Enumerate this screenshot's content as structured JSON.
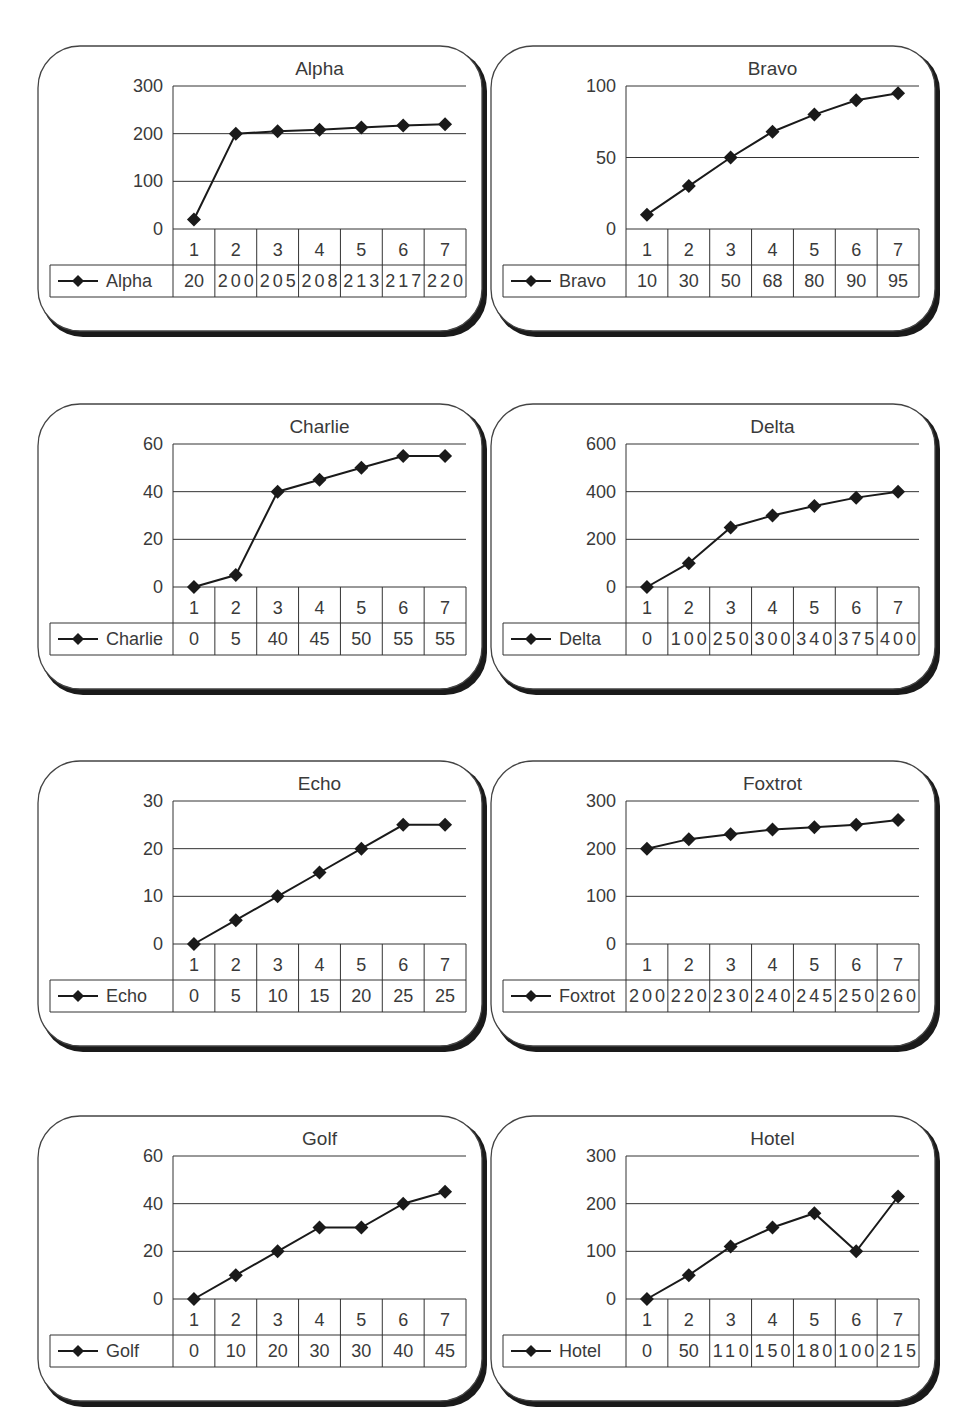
{
  "chart_data": [
    {
      "type": "line",
      "title": "Alpha",
      "categories": [
        "1",
        "2",
        "3",
        "4",
        "5",
        "6",
        "7"
      ],
      "series": [
        {
          "name": "Alpha",
          "values": [
            20,
            200,
            205,
            208,
            213,
            217,
            220
          ]
        }
      ],
      "yticks": [
        0,
        100,
        200,
        300
      ],
      "ylim": [
        0,
        300
      ],
      "xlabel": "",
      "ylabel": "",
      "grid": true,
      "legend_position": "data-table"
    },
    {
      "type": "line",
      "title": "Bravo",
      "categories": [
        "1",
        "2",
        "3",
        "4",
        "5",
        "6",
        "7"
      ],
      "series": [
        {
          "name": "Bravo",
          "values": [
            10,
            30,
            50,
            68,
            80,
            90,
            95
          ]
        }
      ],
      "yticks": [
        0,
        50,
        100
      ],
      "ylim": [
        0,
        100
      ],
      "xlabel": "",
      "ylabel": "",
      "grid": true,
      "legend_position": "data-table"
    },
    {
      "type": "line",
      "title": "Charlie",
      "categories": [
        "1",
        "2",
        "3",
        "4",
        "5",
        "6",
        "7"
      ],
      "series": [
        {
          "name": "Charlie",
          "values": [
            0,
            5,
            40,
            45,
            50,
            55,
            55
          ]
        }
      ],
      "yticks": [
        0,
        20,
        40,
        60
      ],
      "ylim": [
        0,
        60
      ],
      "xlabel": "",
      "ylabel": "",
      "grid": true,
      "legend_position": "data-table"
    },
    {
      "type": "line",
      "title": "Delta",
      "categories": [
        "1",
        "2",
        "3",
        "4",
        "5",
        "6",
        "7"
      ],
      "series": [
        {
          "name": "Delta",
          "values": [
            0,
            100,
            250,
            300,
            340,
            375,
            400
          ]
        }
      ],
      "yticks": [
        0,
        200,
        400,
        600
      ],
      "ylim": [
        0,
        600
      ],
      "xlabel": "",
      "ylabel": "",
      "grid": true,
      "legend_position": "data-table"
    },
    {
      "type": "line",
      "title": "Echo",
      "categories": [
        "1",
        "2",
        "3",
        "4",
        "5",
        "6",
        "7"
      ],
      "series": [
        {
          "name": "Echo",
          "values": [
            0,
            5,
            10,
            15,
            20,
            25,
            25
          ]
        }
      ],
      "yticks": [
        0,
        10,
        20,
        30
      ],
      "ylim": [
        0,
        30
      ],
      "xlabel": "",
      "ylabel": "",
      "grid": true,
      "legend_position": "data-table"
    },
    {
      "type": "line",
      "title": "Foxtrot",
      "categories": [
        "1",
        "2",
        "3",
        "4",
        "5",
        "6",
        "7"
      ],
      "series": [
        {
          "name": "Foxtrot",
          "values": [
            200,
            220,
            230,
            240,
            245,
            250,
            260
          ]
        }
      ],
      "yticks": [
        0,
        100,
        200,
        300
      ],
      "ylim": [
        0,
        300
      ],
      "xlabel": "",
      "ylabel": "",
      "grid": true,
      "legend_position": "data-table"
    },
    {
      "type": "line",
      "title": "Golf",
      "categories": [
        "1",
        "2",
        "3",
        "4",
        "5",
        "6",
        "7"
      ],
      "series": [
        {
          "name": "Golf",
          "values": [
            0,
            10,
            20,
            30,
            30,
            40,
            45
          ]
        }
      ],
      "yticks": [
        0,
        20,
        40,
        60
      ],
      "ylim": [
        0,
        60
      ],
      "xlabel": "",
      "ylabel": "",
      "grid": true,
      "legend_position": "data-table"
    },
    {
      "type": "line",
      "title": "Hotel",
      "categories": [
        "1",
        "2",
        "3",
        "4",
        "5",
        "6",
        "7"
      ],
      "series": [
        {
          "name": "Hotel",
          "values": [
            0,
            50,
            110,
            150,
            180,
            100,
            215
          ]
        }
      ],
      "yticks": [
        0,
        100,
        200,
        300
      ],
      "ylim": [
        0,
        300
      ],
      "xlabel": "",
      "ylabel": "",
      "grid": true,
      "legend_position": "data-table"
    }
  ],
  "style": {
    "line_color": "#1a1a1a",
    "grid_color": "#333333",
    "text_color": "#3a3a3a",
    "border_color": "#444444",
    "shadow_color": "#1a1a1a",
    "background": "#ffffff"
  }
}
